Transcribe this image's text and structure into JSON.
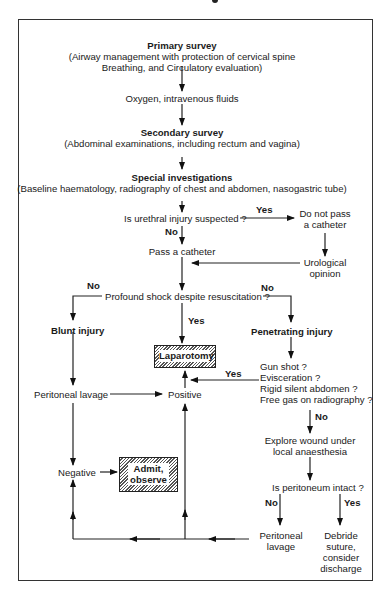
{
  "diagram": {
    "primary_survey": {
      "title": "Primary survey",
      "line1": "(Airway management with protection of cervical spine",
      "line2": "Breathing, and Circulatory evaluation)"
    },
    "oxygen": "Oxygen, intravenous fluids",
    "secondary_survey": {
      "title": "Secondary survey",
      "detail": "(Abdominal examinations, including rectum and vagina)"
    },
    "special_investigations": {
      "title": "Special investigations",
      "detail": "(Baseline haematology, radiography of chest and abdomen, nasogastric tube)"
    },
    "urethral_question": "Is urethral injury suspected ?",
    "do_not_pass": [
      "Do not pass",
      "a catheter"
    ],
    "pass_catheter": "Pass a catheter",
    "urological_opinion": [
      "Urological",
      "opinion"
    ],
    "shock_question": "Profound shock despite resuscitation ?",
    "blunt_injury": "Blunt injury",
    "penetrating_injury": "Penetrating injury",
    "laparotomy": "Laparotomy",
    "penetrating_questions": [
      "Gun shot ?",
      "Evisceration ?",
      "Rigid silent abdomen ?",
      "Free gas on radiography ?"
    ],
    "peritoneal_lavage_left": "Peritoneal  lavage",
    "positive": "Positive",
    "explore_wound": [
      "Explore wound under",
      "local anaesthesia"
    ],
    "negative": "Negative",
    "admit_observe": [
      "Admit,",
      "observe"
    ],
    "peritoneum_question": "Is peritoneum intact ?",
    "peritoneal_lavage_right": [
      "Peritoneal",
      "lavage"
    ],
    "debride": [
      "Debride",
      "suture,",
      "consider",
      "discharge"
    ],
    "labels": {
      "yes": "Yes",
      "no": "No"
    }
  }
}
